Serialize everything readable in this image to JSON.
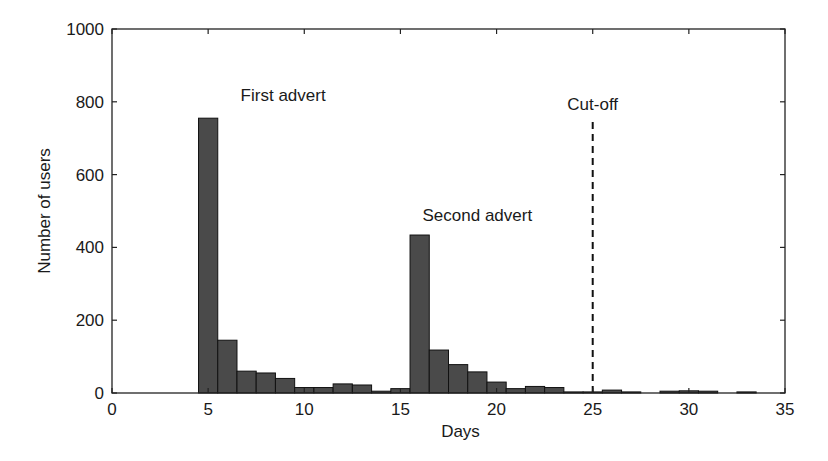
{
  "chart_data": {
    "type": "bar",
    "title": "",
    "xlabel": "Days",
    "ylabel": "Number of users",
    "xlim": [
      0,
      35
    ],
    "ylim": [
      0,
      1000
    ],
    "xticks": [
      0,
      5,
      10,
      15,
      20,
      25,
      30,
      35
    ],
    "yticks": [
      0,
      200,
      400,
      600,
      800,
      1000
    ],
    "grid": false,
    "legend": null,
    "bar_width": 1,
    "x": [
      5,
      6,
      7,
      8,
      9,
      10,
      11,
      12,
      13,
      14,
      15,
      16,
      17,
      18,
      19,
      20,
      21,
      22,
      23,
      24,
      25,
      26,
      27,
      28,
      29,
      30,
      31,
      32,
      33,
      34
    ],
    "values": [
      755,
      145,
      60,
      55,
      40,
      15,
      15,
      25,
      22,
      5,
      12,
      434,
      118,
      78,
      58,
      30,
      12,
      18,
      15,
      3,
      3,
      8,
      3,
      0,
      5,
      6,
      5,
      0,
      3,
      0
    ],
    "bar_color": "#4a4a4a",
    "annotations": [
      {
        "text": "First advert",
        "x": 8.9,
        "y": 818
      },
      {
        "text": "Second advert",
        "x": 19.0,
        "y": 490
      },
      {
        "text": "Cut-off",
        "x": 25.0,
        "y": 795
      }
    ],
    "vlines": [
      {
        "x": 25,
        "ymin": 0,
        "ymax": 758,
        "style": "dashed",
        "label": "Cut-off"
      }
    ]
  }
}
